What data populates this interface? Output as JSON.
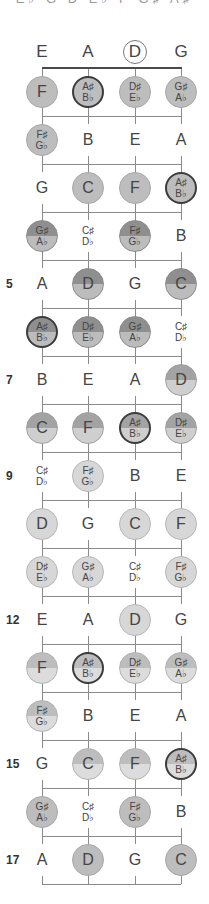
{
  "top_text": "E♭ G D E♭ F G♯ A♯",
  "strings": [
    {
      "name": "E",
      "x": 42,
      "circled": false
    },
    {
      "name": "A",
      "x": 88,
      "circled": false
    },
    {
      "name": "D",
      "x": 135,
      "circled": true
    },
    {
      "name": "G",
      "x": 181,
      "circled": false
    }
  ],
  "layout": {
    "nut_y": 68,
    "first_row_y": 92,
    "row_spacing": 48,
    "bottom_y": 884
  },
  "fret_numbers": [
    {
      "fret": 5,
      "label": "5"
    },
    {
      "fret": 7,
      "label": "7"
    },
    {
      "fret": 9,
      "label": "9"
    },
    {
      "fret": 12,
      "label": "12"
    },
    {
      "fret": 15,
      "label": "15"
    },
    {
      "fret": 17,
      "label": "17"
    }
  ],
  "frets": [
    {
      "fret": 1,
      "notes": [
        {
          "t": "F",
          "s": "",
          "style": "c-mid"
        },
        {
          "t": "A♯",
          "s": "B♭",
          "style": "c-mid ring"
        },
        {
          "t": "D♯",
          "s": "E♭",
          "style": "c-mid"
        },
        {
          "t": "G♯",
          "s": "A♭",
          "style": "c-mid"
        }
      ]
    },
    {
      "fret": 2,
      "notes": [
        {
          "t": "F♯",
          "s": "G♭",
          "style": "c-mid"
        },
        {
          "t": "B",
          "s": "",
          "style": "plain"
        },
        {
          "t": "E",
          "s": "",
          "style": "plain"
        },
        {
          "t": "A",
          "s": "",
          "style": "plain"
        }
      ]
    },
    {
      "fret": 3,
      "notes": [
        {
          "t": "G",
          "s": "",
          "style": "plain"
        },
        {
          "t": "C",
          "s": "",
          "style": "c-mid"
        },
        {
          "t": "F",
          "s": "",
          "style": "c-mid"
        },
        {
          "t": "A♯",
          "s": "B♭",
          "style": "c-mid ring"
        }
      ]
    },
    {
      "fret": 4,
      "notes": [
        {
          "t": "G♯",
          "s": "A♭",
          "style": "c-split-dark"
        },
        {
          "t": "C♯",
          "s": "D♭",
          "style": "plain"
        },
        {
          "t": "F♯",
          "s": "G♭",
          "style": "c-split-dark"
        },
        {
          "t": "B",
          "s": "",
          "style": "plain"
        }
      ]
    },
    {
      "fret": 5,
      "notes": [
        {
          "t": "A",
          "s": "",
          "style": "plain"
        },
        {
          "t": "D",
          "s": "",
          "style": "c-split-dark"
        },
        {
          "t": "G",
          "s": "",
          "style": "plain"
        },
        {
          "t": "C",
          "s": "",
          "style": "c-split-dark"
        }
      ]
    },
    {
      "fret": 6,
      "notes": [
        {
          "t": "A♯",
          "s": "B♭",
          "style": "c-split-dark ring"
        },
        {
          "t": "D♯",
          "s": "E♭",
          "style": "c-split-dark"
        },
        {
          "t": "G♯",
          "s": "A♭",
          "style": "c-split-dark"
        },
        {
          "t": "C♯",
          "s": "D♭",
          "style": "plain"
        }
      ]
    },
    {
      "fret": 7,
      "notes": [
        {
          "t": "B",
          "s": "",
          "style": "plain"
        },
        {
          "t": "E",
          "s": "",
          "style": "plain"
        },
        {
          "t": "A",
          "s": "",
          "style": "plain"
        },
        {
          "t": "D",
          "s": "",
          "style": "c-split-mid"
        }
      ]
    },
    {
      "fret": 8,
      "notes": [
        {
          "t": "C",
          "s": "",
          "style": "c-split-mid"
        },
        {
          "t": "F",
          "s": "",
          "style": "c-split-mid"
        },
        {
          "t": "A♯",
          "s": "B♭",
          "style": "c-split-mid ring"
        },
        {
          "t": "D♯",
          "s": "E♭",
          "style": "c-split-mid"
        }
      ]
    },
    {
      "fret": 9,
      "notes": [
        {
          "t": "C♯",
          "s": "D♭",
          "style": "plain"
        },
        {
          "t": "F♯",
          "s": "G♭",
          "style": "c-light"
        },
        {
          "t": "B",
          "s": "",
          "style": "plain"
        },
        {
          "t": "E",
          "s": "",
          "style": "plain"
        }
      ]
    },
    {
      "fret": 10,
      "notes": [
        {
          "t": "D",
          "s": "",
          "style": "c-light"
        },
        {
          "t": "G",
          "s": "",
          "style": "plain"
        },
        {
          "t": "C",
          "s": "",
          "style": "c-light"
        },
        {
          "t": "F",
          "s": "",
          "style": "c-light"
        }
      ]
    },
    {
      "fret": 11,
      "notes": [
        {
          "t": "D♯",
          "s": "E♭",
          "style": "c-light"
        },
        {
          "t": "G♯",
          "s": "A♭",
          "style": "c-light"
        },
        {
          "t": "C♯",
          "s": "D♭",
          "style": "plain"
        },
        {
          "t": "F♯",
          "s": "G♭",
          "style": "c-light"
        }
      ]
    },
    {
      "fret": 12,
      "notes": [
        {
          "t": "E",
          "s": "",
          "style": "plain"
        },
        {
          "t": "A",
          "s": "",
          "style": "plain"
        },
        {
          "t": "D",
          "s": "",
          "style": "c-light"
        },
        {
          "t": "G",
          "s": "",
          "style": "plain"
        }
      ]
    },
    {
      "fret": 13,
      "notes": [
        {
          "t": "F",
          "s": "",
          "style": "c-split-light"
        },
        {
          "t": "A♯",
          "s": "B♭",
          "style": "c-split-light ring"
        },
        {
          "t": "D♯",
          "s": "E♭",
          "style": "c-split-light"
        },
        {
          "t": "G♯",
          "s": "A♭",
          "style": "c-split-light"
        }
      ]
    },
    {
      "fret": 14,
      "notes": [
        {
          "t": "F♯",
          "s": "G♭",
          "style": "c-split-light"
        },
        {
          "t": "B",
          "s": "",
          "style": "plain"
        },
        {
          "t": "E",
          "s": "",
          "style": "plain"
        },
        {
          "t": "A",
          "s": "",
          "style": "plain"
        }
      ]
    },
    {
      "fret": 15,
      "notes": [
        {
          "t": "G",
          "s": "",
          "style": "plain"
        },
        {
          "t": "C",
          "s": "",
          "style": "c-split-light"
        },
        {
          "t": "F",
          "s": "",
          "style": "c-split-light"
        },
        {
          "t": "A♯",
          "s": "B♭",
          "style": "c-split-light ring"
        }
      ]
    },
    {
      "fret": 16,
      "notes": [
        {
          "t": "G♯",
          "s": "A♭",
          "style": "c-mid"
        },
        {
          "t": "C♯",
          "s": "D♭",
          "style": "plain"
        },
        {
          "t": "F♯",
          "s": "G♭",
          "style": "c-mid"
        },
        {
          "t": "B",
          "s": "",
          "style": "plain"
        }
      ]
    },
    {
      "fret": 17,
      "notes": [
        {
          "t": "A",
          "s": "",
          "style": "plain"
        },
        {
          "t": "D",
          "s": "",
          "style": "c-mid"
        },
        {
          "t": "G",
          "s": "",
          "style": "plain"
        },
        {
          "t": "C",
          "s": "",
          "style": "c-mid"
        }
      ]
    }
  ]
}
